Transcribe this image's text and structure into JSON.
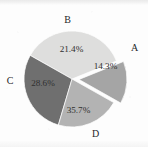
{
  "chart_data": {
    "type": "pie",
    "title": "",
    "subtitle": "",
    "xlabel": "",
    "ylabel": "",
    "grid": false,
    "legend_position": "none",
    "labels_position": "outside-category-inside-percent",
    "categories": [
      "A",
      "B",
      "C",
      "D"
    ],
    "values": [
      14.3,
      21.4,
      28.6,
      35.7
    ],
    "value_labels": [
      "14.3%",
      "21.4%",
      "28.6%",
      "35.7%"
    ],
    "units": "percent",
    "total": 100.0,
    "exploded": [
      "A"
    ],
    "start_angle_deg": -22,
    "direction": "clockwise",
    "colors": [
      "#a5a5a5",
      "#b3b3b3",
      "#6f6f6f",
      "#dededd"
    ],
    "slices": [
      {
        "category": "A",
        "value": 14.3,
        "value_label": "14.3%",
        "color": "#a5a5a5",
        "exploded": true,
        "category_label_position": "right"
      },
      {
        "category": "B",
        "value": 21.4,
        "value_label": "21.4%",
        "color": "#b3b3b3",
        "exploded": false,
        "category_label_position": "top"
      },
      {
        "category": "C",
        "value": 28.6,
        "value_label": "28.6%",
        "color": "#6f6f6f",
        "exploded": false,
        "category_label_position": "left"
      },
      {
        "category": "D",
        "value": 35.7,
        "value_label": "35.7%",
        "color": "#dededd",
        "exploded": false,
        "category_label_position": "bottom-right"
      }
    ]
  },
  "figure": {
    "background_color": "#fdfdfd",
    "pie_center_x": 72,
    "pie_center_y": 79,
    "pie_radius": 48
  }
}
